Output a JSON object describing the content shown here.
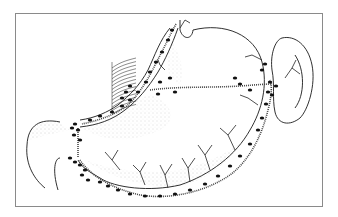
{
  "figure": {
    "frame_color": "#8a8a8a",
    "ink_color": "#1a1a1a",
    "stipple_color": "#9a9a9a",
    "outlines": [
      {
        "name": "stomach-outline",
        "d": "M193 30 C225 22 255 35 262 62 C268 85 262 110 250 130 C236 155 210 175 180 185 C150 192 115 188 100 178 C90 172 82 168 78 160"
      },
      {
        "name": "stomach-lesser-curve",
        "d": "M180 30 L180 20 M193 30 C192 40 183 40 180 30"
      },
      {
        "name": "esophagus-left",
        "d": "M170 28 C160 40 155 55 148 70 C140 85 130 95 118 105 C108 112 95 118 80 120"
      },
      {
        "name": "esophagus-right",
        "d": "M178 28 C172 45 165 60 158 72 C148 88 138 100 125 110 C112 120 98 125 80 127"
      },
      {
        "name": "duodenum",
        "d": "M60 122 C40 118 28 125 27 145 C25 165 35 180 45 188"
      },
      {
        "name": "pylorus-bottom",
        "d": "M60 158 C55 158 52 170 58 190"
      },
      {
        "name": "spleen",
        "d": "M282 38 C295 35 308 45 312 65 C316 85 308 110 300 118 C290 126 278 125 275 112 C272 98 275 85 272 70 C270 55 275 40 282 38 Z"
      },
      {
        "name": "spleen-inner",
        "d": "M295 55 C305 70 305 95 295 108"
      }
    ],
    "vessels": [
      {
        "name": "left-gastric-vessel",
        "d": "M176 24 C170 35 163 50 155 65 C148 80 138 95 128 105 C115 115 100 120 82 124"
      },
      {
        "name": "gastroepiploic-vessel",
        "d": "M80 160 C90 175 110 188 140 195 C170 200 205 192 230 175 C250 160 262 135 268 110 C272 95 272 85 270 80"
      },
      {
        "name": "short-gastric-vessel",
        "d": "M150 90 C180 86 210 88 240 86 C255 85 265 84 272 84"
      },
      {
        "name": "pyloric-link",
        "d": "M78 128 L78 158"
      }
    ],
    "branches": [
      "M120 170 L112 160 L105 152 M112 160 L118 150",
      "M145 185 L140 172 L133 165 M140 172 L146 162",
      "M168 188 L165 175 L160 165 M165 175 L172 164",
      "M190 182 L188 168 L182 158 M188 168 L195 158",
      "M210 170 L205 155 L198 145 M205 155 L212 145",
      "M235 150 L228 135 L220 128 M228 135 L236 125",
      "M258 105 L248 98 L240 95",
      "M262 60 L252 55 L245 57",
      "M285 78 L292 68 L296 60 M292 68 L300 74",
      "M180 28 L185 20 L190 23",
      "M165 70 L160 65 L158 60"
    ],
    "nodes": [
      [
        172,
        30
      ],
      [
        168,
        40
      ],
      [
        162,
        52
      ],
      [
        156,
        62
      ],
      [
        150,
        72
      ],
      [
        146,
        82
      ],
      [
        138,
        92
      ],
      [
        130,
        100
      ],
      [
        122,
        106
      ],
      [
        112,
        112
      ],
      [
        100,
        116
      ],
      [
        90,
        120
      ],
      [
        75,
        124
      ],
      [
        72,
        128
      ],
      [
        78,
        130
      ],
      [
        74,
        135
      ],
      [
        80,
        140
      ],
      [
        70,
        158
      ],
      [
        75,
        162
      ],
      [
        80,
        165
      ],
      [
        85,
        170
      ],
      [
        82,
        175
      ],
      [
        88,
        180
      ],
      [
        100,
        182
      ],
      [
        108,
        186
      ],
      [
        118,
        190
      ],
      [
        130,
        194
      ],
      [
        145,
        196
      ],
      [
        160,
        196
      ],
      [
        175,
        194
      ],
      [
        190,
        190
      ],
      [
        205,
        184
      ],
      [
        218,
        176
      ],
      [
        230,
        166
      ],
      [
        240,
        156
      ],
      [
        250,
        144
      ],
      [
        258,
        130
      ],
      [
        262,
        118
      ],
      [
        266,
        104
      ],
      [
        268,
        92
      ],
      [
        270,
        82
      ],
      [
        262,
        70
      ],
      [
        265,
        64
      ],
      [
        276,
        86
      ],
      [
        272,
        95
      ],
      [
        160,
        82
      ],
      [
        170,
        78
      ],
      [
        158,
        94
      ],
      [
        175,
        92
      ],
      [
        240,
        84
      ],
      [
        250,
        90
      ],
      [
        235,
        78
      ],
      [
        126,
        92
      ],
      [
        130,
        86
      ],
      [
        122,
        98
      ]
    ],
    "bundle_hatch": {
      "x": 112,
      "y": 62,
      "w": 24,
      "h": 50
    }
  }
}
